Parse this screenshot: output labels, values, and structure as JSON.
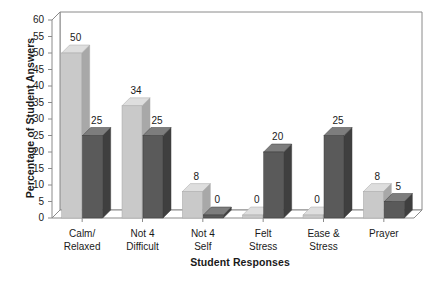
{
  "chart_data": {
    "type": "bar",
    "title": "",
    "subtitle": "",
    "xlabel": "Student Responses",
    "ylabel": "Percentage of Student Answers",
    "categories": [
      "Calm/ Relaxed",
      "Not 4 Difficult",
      "Not 4 Self",
      "Felt Stress",
      "Ease & Stress",
      "Prayer"
    ],
    "category_lines": [
      [
        "Calm/",
        "Relaxed"
      ],
      [
        "Not 4",
        "Difficult"
      ],
      [
        "Not 4",
        "Self"
      ],
      [
        "Felt",
        "Stress"
      ],
      [
        "Ease &",
        "Stress"
      ],
      [
        "Prayer"
      ]
    ],
    "series": [
      {
        "name": "Series 1",
        "color": "#c9c9c9",
        "values": [
          50,
          34,
          8,
          0,
          0,
          8
        ]
      },
      {
        "name": "Series 2",
        "color": "#5a5a5a",
        "values": [
          25,
          25,
          0,
          20,
          25,
          5
        ]
      }
    ],
    "value_labels": [
      {
        "text": "50"
      },
      {
        "text": "25"
      },
      {
        "text": "34"
      },
      {
        "text": "25"
      },
      {
        "text": "8"
      },
      {
        "text": "0"
      },
      {
        "text": "0"
      },
      {
        "text": "20"
      },
      {
        "text": "0"
      },
      {
        "text": "25"
      },
      {
        "text": "8"
      },
      {
        "text": "5"
      }
    ],
    "ylim": [
      0,
      60
    ],
    "ytick_step": 5,
    "yticks": [
      "60",
      "55",
      "50",
      "45",
      "40",
      "35",
      "30",
      "25",
      "20",
      "15",
      "10",
      "5",
      "0"
    ],
    "grid": false,
    "legend": "none",
    "style": "3d-columns",
    "colors": {
      "series1_front": "#c9c9c9",
      "series1_top": "#dedede",
      "series1_side": "#a8a8a8",
      "series2_front": "#5a5a5a",
      "series2_top": "#7d7d7d",
      "series2_side": "#3f3f3f",
      "axis": "#8a8a8a",
      "text": "#1a1a1a",
      "background": "#ffffff"
    }
  }
}
